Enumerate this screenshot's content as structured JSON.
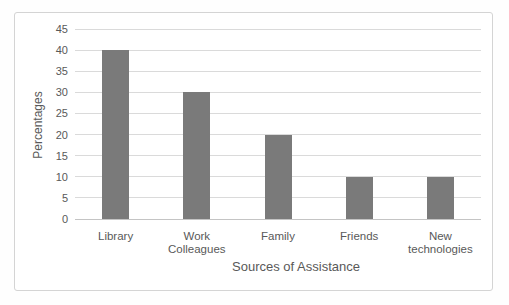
{
  "chart_data": {
    "type": "bar",
    "categories": [
      "Library",
      "Work Colleagues",
      "Family",
      "Friends",
      "New technologies"
    ],
    "values": [
      40,
      30,
      20,
      10,
      10
    ],
    "title": "",
    "xlabel": "Sources of Assistance",
    "ylabel": "Percentages",
    "ylim": [
      0,
      45
    ],
    "yticks": [
      0,
      5,
      10,
      15,
      20,
      25,
      30,
      35,
      40,
      45
    ],
    "grid": true,
    "legend": "none",
    "colors": {
      "bar": "#7a7a7a",
      "gridline": "#dadada",
      "axis_line": "#c4c4c4",
      "text": "#595959",
      "frame_border": "#d4d4d4",
      "background": "#ffffff"
    }
  }
}
